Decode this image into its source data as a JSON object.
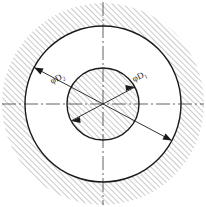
{
  "drawing": {
    "title": "Concentric circles cross-section",
    "background_color": "#ffffff",
    "line_color": "#1a1a1a",
    "hatch_color": "#808080",
    "center": {
      "x": 103,
      "y": 104
    },
    "circles": [
      {
        "name": "outer-circle",
        "label": "D2",
        "radius": 78
      },
      {
        "name": "inner-circle",
        "label": "D1",
        "radius": 36
      }
    ],
    "hatch": {
      "angle_deg": 45,
      "spacing_px": 4,
      "regions": [
        {
          "name": "outer-annulus-hatch",
          "inner_radius": 78,
          "outer_radius": 101
        },
        {
          "name": "inner-circle-hatch",
          "inner_radius": 0,
          "outer_radius": 36
        }
      ]
    },
    "centerlines": [
      {
        "name": "horizontal-centerline",
        "orientation": "horizontal",
        "style": "dash-dot"
      },
      {
        "name": "vertical-centerline",
        "orientation": "vertical",
        "style": "dash-dot"
      }
    ],
    "dimensions": [
      {
        "name": "dimension-d2",
        "symbol": "φ",
        "letter": "D",
        "subscript": "2",
        "text": "φD2",
        "target": "outer-circle",
        "leader_angle_deg": 208,
        "label_x": 56,
        "label_y": 82
      },
      {
        "name": "dimension-d1",
        "symbol": "φ",
        "letter": "D",
        "subscript": "1",
        "text": "φD1",
        "target": "inner-circle",
        "leader_angle_deg": 28,
        "label_x": 139,
        "label_y": 80
      }
    ]
  }
}
